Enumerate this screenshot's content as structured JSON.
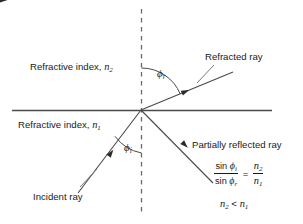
{
  "figure": {
    "kind": "optics-refraction-diagram",
    "background_color": "#ffffff",
    "line_color": "#3a3a3a",
    "text_color": "#1a1a1a"
  },
  "labels": {
    "refracted_ray": "Refracted ray",
    "incident_ray": "Incident ray",
    "partially_reflected_ray": "Partially reflected ray",
    "refractive_index_upper_prefix": "Refractive index, ",
    "refractive_index_upper_symbol": "n",
    "refractive_index_upper_subscript": "2",
    "refractive_index_lower_prefix": "Refractive index, ",
    "refractive_index_lower_symbol": "n",
    "refractive_index_lower_subscript": "1"
  },
  "angles": {
    "refraction_symbol": "ϕ",
    "refraction_subscript": "r",
    "incidence_symbol": "ϕ",
    "incidence_subscript": "i"
  },
  "equation": {
    "numerator_fn": "sin ",
    "numerator_symbol": "ϕ",
    "numerator_subscript": "i",
    "denominator_fn": "sin ",
    "denominator_symbol": "ϕ",
    "denominator_subscript": "r",
    "equals": "=",
    "rhs_numerator_symbol": "n",
    "rhs_numerator_subscript": "2",
    "rhs_denominator_symbol": "n",
    "rhs_denominator_subscript": "1",
    "inequality_left_symbol": "n",
    "inequality_left_subscript": "2",
    "inequality_operator": " < ",
    "inequality_right_symbol": "n",
    "inequality_right_subscript": "1"
  },
  "geometry": {
    "origin": {
      "x": 141,
      "y": 110
    },
    "interface_line": {
      "x1": 12,
      "y1": 110,
      "x2": 272,
      "y2": 110
    },
    "normal_line": {
      "x": 141,
      "y1": 9,
      "y2": 212,
      "dash": "4,4"
    },
    "refracted_ray": {
      "x1": 141,
      "y1": 110,
      "x2": 233,
      "y2": 72
    },
    "incident_ray": {
      "x1": 78,
      "y1": 193,
      "x2": 141,
      "y2": 110
    },
    "reflected_ray": {
      "x1": 141,
      "y1": 110,
      "x2": 213,
      "y2": 183
    },
    "refracted_leader": {
      "x1": 196,
      "y1": 85,
      "x2": 213,
      "y2": 66
    },
    "incident_leader": {
      "x1": 96,
      "y1": 170,
      "x2": 78,
      "y2": 188
    }
  }
}
